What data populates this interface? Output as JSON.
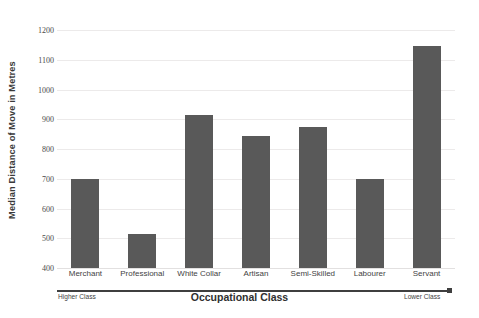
{
  "chart_data": {
    "type": "bar",
    "title": "",
    "subtitle": "",
    "xlabel": "Occupational Class",
    "ylabel": "Median Distance of Move in Metres",
    "categories": [
      "Merchant",
      "Professional",
      "White Collar",
      "Artisan",
      "Semi-Skilled",
      "Labourer",
      "Servant"
    ],
    "values": [
      700,
      515,
      915,
      845,
      875,
      700,
      1145
    ],
    "ylim": [
      400,
      1200
    ],
    "ytick_step": 100,
    "ytick_labels": [
      "1200",
      "1100",
      "1000",
      "900",
      "800",
      "700",
      "600",
      "500",
      "400"
    ],
    "ytick_values": [
      1200,
      1100,
      1000,
      900,
      800,
      700,
      600,
      500,
      400
    ],
    "grid": true,
    "legend": null,
    "bar_color": "#595959",
    "gridline_color": "#eceaea",
    "annotations": {
      "axis_left_end": "Higher Class",
      "axis_right_end": "Lower Class"
    }
  },
  "axis": {
    "x_title": "Occupational Class",
    "y_title": "Median Distance of Move in Metres",
    "left_end_label": "Higher Class",
    "right_end_label": "Lower Class"
  }
}
